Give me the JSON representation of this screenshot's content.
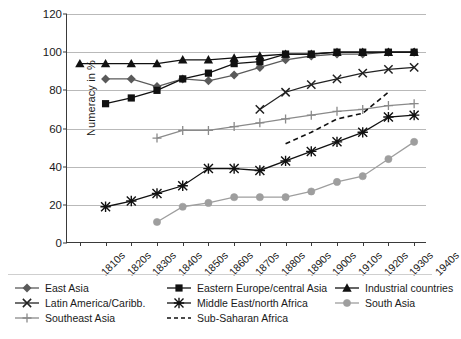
{
  "axes": {
    "ylabel": "Numeracy in %",
    "yticks": [
      0,
      20,
      40,
      60,
      80,
      100,
      120
    ],
    "xticks": [
      "1810s",
      "1820s",
      "1830s",
      "1840s",
      "1850s",
      "1860s",
      "1870s",
      "1880s",
      "1890s",
      "1900s",
      "1910s",
      "1920s",
      "1930s",
      "1940s"
    ]
  },
  "legend": {
    "items": [
      {
        "label": "East Asia",
        "marker": "diamond",
        "color": "#5a5a5a",
        "dashed": false
      },
      {
        "label": "Eastern Europe/central Asia",
        "marker": "square",
        "color": "#111111",
        "dashed": false
      },
      {
        "label": "Industrial countries",
        "marker": "triangle",
        "color": "#111111",
        "dashed": false
      },
      {
        "label": "Latin America/Caribb.",
        "marker": "cross",
        "color": "#222222",
        "dashed": false
      },
      {
        "label": "Middle East/north Africa",
        "marker": "asterisk",
        "color": "#111111",
        "dashed": false
      },
      {
        "label": "South Asia",
        "marker": "circle",
        "color": "#9e9e9e",
        "dashed": false
      },
      {
        "label": "Southeast Asia",
        "marker": "plus",
        "color": "#8a8a8a",
        "dashed": false
      },
      {
        "label": "Sub-Saharan Africa",
        "marker": "none",
        "color": "#111111",
        "dashed": true
      }
    ]
  },
  "chart_data": {
    "type": "line",
    "title": "",
    "xlabel": "",
    "ylabel": "Numeracy in %",
    "ylim": [
      0,
      120
    ],
    "ytick_step": 20,
    "grid": "horizontal",
    "legend_position": "bottom",
    "categories": [
      "1810s",
      "1820s",
      "1830s",
      "1840s",
      "1850s",
      "1860s",
      "1870s",
      "1880s",
      "1890s",
      "1900s",
      "1910s",
      "1920s",
      "1930s",
      "1940s"
    ],
    "series": [
      {
        "name": "East Asia",
        "marker": "diamond",
        "color": "#5a5a5a",
        "values": [
          null,
          86,
          86,
          82,
          86,
          85,
          88,
          92,
          96,
          98,
          99,
          99,
          100,
          100
        ]
      },
      {
        "name": "Eastern Europe/central Asia",
        "marker": "square",
        "color": "#111111",
        "values": [
          null,
          73,
          76,
          80,
          86,
          89,
          94,
          95,
          99,
          99,
          100,
          100,
          100,
          100
        ]
      },
      {
        "name": "Industrial countries",
        "marker": "triangle",
        "color": "#111111",
        "values": [
          94,
          94,
          94,
          94,
          96,
          96,
          97,
          98,
          99,
          99,
          100,
          100,
          100,
          100
        ]
      },
      {
        "name": "Latin America/Caribb.",
        "marker": "cross",
        "color": "#222222",
        "values": [
          null,
          null,
          null,
          null,
          null,
          null,
          null,
          70,
          79,
          83,
          86,
          89,
          91,
          92
        ]
      },
      {
        "name": "Middle East/north Africa",
        "marker": "asterisk",
        "color": "#111111",
        "values": [
          null,
          19,
          22,
          26,
          30,
          39,
          39,
          38,
          43,
          48,
          53,
          58,
          66,
          67
        ]
      },
      {
        "name": "South Asia",
        "marker": "circle",
        "color": "#9e9e9e",
        "values": [
          null,
          null,
          null,
          11,
          19,
          21,
          24,
          24,
          24,
          27,
          32,
          35,
          44,
          53
        ]
      },
      {
        "name": "Southeast Asia",
        "marker": "plus",
        "color": "#8a8a8a",
        "values": [
          null,
          null,
          null,
          55,
          59,
          59,
          61,
          63,
          65,
          67,
          69,
          70,
          72,
          73
        ]
      },
      {
        "name": "Sub-Saharan Africa",
        "marker": "none",
        "color": "#111111",
        "dashed": true,
        "values": [
          null,
          null,
          null,
          null,
          null,
          null,
          null,
          null,
          52,
          58,
          65,
          68,
          79,
          null
        ]
      }
    ]
  }
}
